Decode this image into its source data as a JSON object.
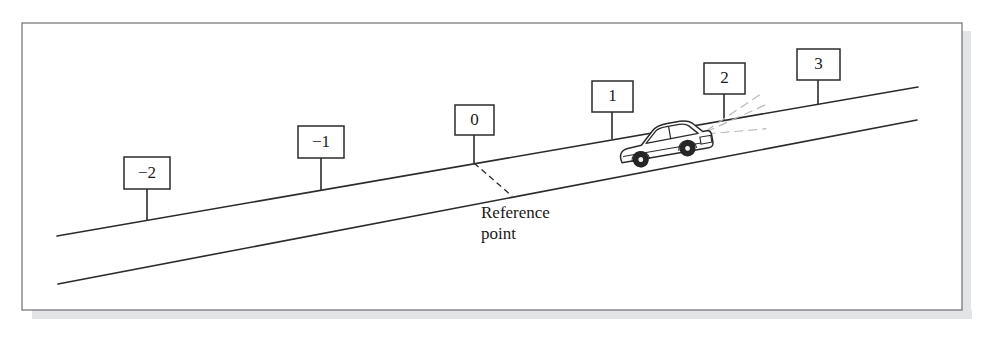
{
  "figure": {
    "kind": "illustration-diagram",
    "frame": {
      "border_color": "#6b6e72",
      "shadow_color": "#e3e4e6",
      "background_color": "#ffffff",
      "x": 22,
      "y": 23,
      "width": 940,
      "height": 287
    },
    "road": {
      "line_color": "#2b2b2b",
      "upper_line": {
        "x1": 57,
        "y1": 236,
        "x2": 918,
        "y2": 87
      },
      "lower_line": {
        "x1": 58,
        "y1": 284,
        "x2": 917,
        "y2": 120
      }
    },
    "signs": [
      {
        "label": "−2",
        "box_x": 124,
        "box_y": 157,
        "box_w": 46,
        "box_h": 32,
        "pole_x": 147,
        "pole_y2": 221
      },
      {
        "label": "−1",
        "box_x": 298,
        "box_y": 126,
        "box_w": 46,
        "box_h": 32,
        "pole_x": 321,
        "pole_y2": 191
      },
      {
        "label": "0",
        "box_x": 455,
        "box_y": 105,
        "box_w": 39,
        "box_h": 30,
        "pole_x": 474,
        "pole_y2": 163
      },
      {
        "label": "1",
        "box_x": 592,
        "box_y": 81,
        "box_w": 41,
        "box_h": 31,
        "pole_x": 612,
        "pole_y2": 139
      },
      {
        "label": "2",
        "box_x": 704,
        "box_y": 63,
        "box_w": 41,
        "box_h": 31,
        "pole_x": 724,
        "pole_y2": 120
      },
      {
        "label": "3",
        "box_x": 797,
        "box_y": 49,
        "box_w": 43,
        "box_h": 31,
        "pole_x": 818,
        "pole_y2": 104
      }
    ],
    "reference": {
      "dashed_line": {
        "x1": 474,
        "y1": 163,
        "x2": 512,
        "y2": 196
      },
      "text_line1": "Reference",
      "text_line2": "point",
      "text_x": 481,
      "text_y1": 218,
      "text_y2": 239
    },
    "car": {
      "body_color": "#ffffff",
      "outline_color": "#2b2b2b",
      "wheel_color": "#262626",
      "beam_color": "#b8b8b8",
      "position_note": "between markers 1 and 2, facing right, uphill",
      "headlight_beams": 3
    }
  }
}
